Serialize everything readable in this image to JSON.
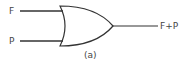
{
  "diagram": {
    "type": "logic-gate",
    "gate": "OR",
    "inputs": [
      {
        "label": "F"
      },
      {
        "label": "P"
      }
    ],
    "output": {
      "label": "F+P"
    },
    "caption": "(a)",
    "colors": {
      "stroke": "#333333",
      "text": "#444444",
      "background": "#ffffff"
    }
  }
}
